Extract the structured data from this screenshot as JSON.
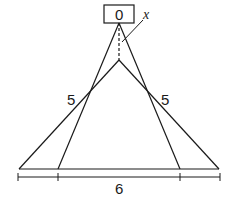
{
  "diagram": {
    "box": {
      "label": "0"
    },
    "pointer": {
      "label": "x"
    },
    "left_side": {
      "label": "5"
    },
    "right_side": {
      "label": "5"
    },
    "base": {
      "label": "6"
    },
    "colors": {
      "stroke": "#1a1a1a",
      "background": "#ffffff"
    }
  }
}
